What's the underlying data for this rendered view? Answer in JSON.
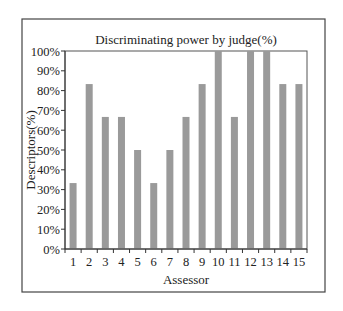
{
  "chart_data": {
    "type": "bar",
    "title": "Discriminating power by judge(%)",
    "xlabel": "Assessor",
    "ylabel": "Descriptors(%)",
    "categories": [
      "1",
      "2",
      "3",
      "4",
      "5",
      "6",
      "7",
      "8",
      "9",
      "10",
      "11",
      "12",
      "13",
      "14",
      "15"
    ],
    "values": [
      33.3,
      83.3,
      66.7,
      66.7,
      50,
      33.3,
      50,
      66.7,
      83.3,
      100,
      66.7,
      100,
      100,
      83.3,
      83.3
    ],
    "ylim": [
      0,
      100
    ],
    "yticks": [
      0,
      10,
      20,
      30,
      40,
      50,
      60,
      70,
      80,
      90,
      100
    ],
    "ytick_labels": [
      "0%",
      "10%",
      "20%",
      "30%",
      "40%",
      "50%",
      "60%",
      "70%",
      "80%",
      "90%",
      "100%"
    ],
    "grid": false,
    "legend": "none",
    "bar_color": "#9a9a9a"
  }
}
